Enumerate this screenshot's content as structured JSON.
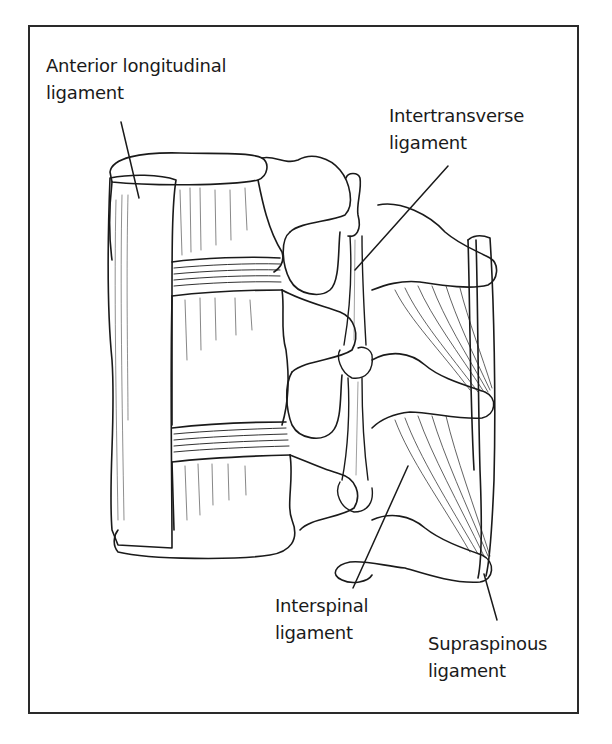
{
  "diagram": {
    "colors": {
      "ink": "#1a1a1a",
      "background": "#ffffff",
      "frame": "#2a2a2a"
    },
    "labels": [
      {
        "id": "anterior-longitudinal",
        "line1": "Anterior longitudinal",
        "line2": "ligament"
      },
      {
        "id": "intertransverse",
        "line1": "Intertransverse",
        "line2": "ligament"
      },
      {
        "id": "interspinal",
        "line1": "Interspinal",
        "line2": "ligament"
      },
      {
        "id": "supraspinous",
        "line1": "Supraspinous",
        "line2": "ligament"
      }
    ]
  }
}
